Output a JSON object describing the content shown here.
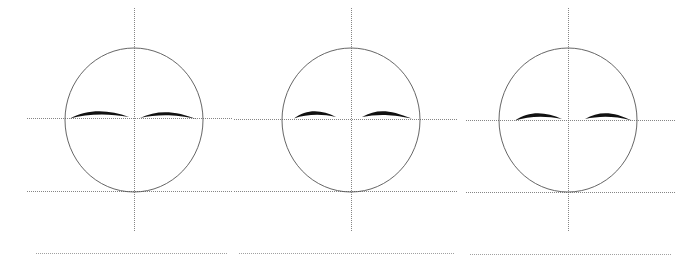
{
  "figure": {
    "type": "line-drawing-diagram",
    "canvas": {
      "width": 699,
      "height": 269,
      "background": "#ffffff"
    },
    "panel_count": 3,
    "colors": {
      "head_outline": "#555555",
      "guide_line": "#666666",
      "guide_line_light": "#8a8a8a",
      "brow": "#111111",
      "background": "#ffffff"
    },
    "stroke_widths": {
      "head_outline": 0.9,
      "guide_line": 0.8,
      "brow": 1.0
    },
    "shared_geometry": {
      "eye_line_y": 118,
      "chin_line_y": 191,
      "base_line_y": 253,
      "circle_top_y": 48,
      "circle_bottom_y": 192,
      "circle_radius_x": 69,
      "circle_radius_y": 72,
      "vertical_axis_top_y": 8,
      "vertical_axis_bottom_y": 232
    },
    "panels": [
      {
        "name": "head-study-1",
        "label": "Study 1",
        "center_x": 134,
        "center_y": 120,
        "circle": {
          "cx": 134,
          "cy": 120,
          "rx": 69,
          "ry": 72
        },
        "vertical_axis": {
          "x": 134,
          "y1": 8,
          "y2": 232,
          "style": "dotted"
        },
        "horizontal_lines": [
          {
            "name": "eye-line",
            "y": 118,
            "x1": 27,
            "x2": 232,
            "style": "dotted"
          },
          {
            "name": "chin-line",
            "y": 191,
            "x1": 27,
            "x2": 232,
            "style": "dotted"
          },
          {
            "name": "base-line",
            "y": 253,
            "x1": 36,
            "x2": 228,
            "style": "dotted"
          }
        ],
        "brows": [
          {
            "name": "brow-left",
            "side": "left",
            "x_start": 70,
            "x_end": 129,
            "peak_x": 101,
            "peak_y": 110,
            "thickness": 2.4
          },
          {
            "name": "brow-right",
            "side": "right",
            "x_start": 140,
            "x_end": 198,
            "peak_x": 167,
            "peak_y": 111,
            "thickness": 2.2
          }
        ]
      },
      {
        "name": "head-study-2",
        "label": "Study 2",
        "center_x": 351,
        "center_y": 120,
        "circle": {
          "cx": 351,
          "cy": 120,
          "rx": 69,
          "ry": 72
        },
        "vertical_axis": {
          "x": 351,
          "y1": 8,
          "y2": 232,
          "style": "dotted"
        },
        "horizontal_lines": [
          {
            "name": "eye-line",
            "y": 119,
            "x1": 234,
            "x2": 458,
            "style": "dotted"
          },
          {
            "name": "chin-line",
            "y": 191,
            "x1": 234,
            "x2": 458,
            "style": "dotted"
          },
          {
            "name": "base-line",
            "y": 253,
            "x1": 239,
            "x2": 455,
            "style": "dotted"
          }
        ],
        "brows": [
          {
            "name": "brow-left",
            "side": "left",
            "x_start": 294,
            "x_end": 336,
            "peak_x": 316,
            "peak_y": 110,
            "thickness": 3.0
          },
          {
            "name": "brow-right",
            "side": "right",
            "x_start": 362,
            "x_end": 412,
            "peak_x": 382,
            "peak_y": 110,
            "thickness": 3.0
          }
        ]
      },
      {
        "name": "head-study-3",
        "label": "Study 3",
        "center_x": 568,
        "center_y": 120,
        "circle": {
          "cx": 568,
          "cy": 120,
          "rx": 69,
          "ry": 72
        },
        "vertical_axis": {
          "x": 568,
          "y1": 8,
          "y2": 232,
          "style": "dotted"
        },
        "horizontal_lines": [
          {
            "name": "eye-line",
            "y": 120,
            "x1": 466,
            "x2": 676,
            "style": "dotted"
          },
          {
            "name": "chin-line",
            "y": 192,
            "x1": 466,
            "x2": 676,
            "style": "dotted"
          },
          {
            "name": "base-line",
            "y": 254,
            "x1": 470,
            "x2": 672,
            "style": "dotted"
          }
        ],
        "brows": [
          {
            "name": "brow-left",
            "side": "left",
            "x_start": 515,
            "x_end": 562,
            "peak_x": 539,
            "peak_y": 112,
            "thickness": 2.8
          },
          {
            "name": "brow-right",
            "side": "right",
            "x_start": 585,
            "x_end": 632,
            "peak_x": 607,
            "peak_y": 112,
            "thickness": 2.8
          }
        ]
      }
    ]
  }
}
